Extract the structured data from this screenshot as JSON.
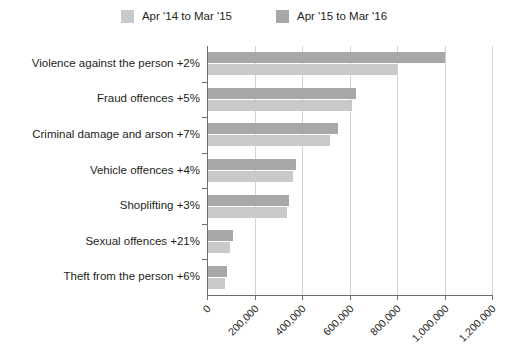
{
  "legend": {
    "entries": [
      {
        "label": "Apr '14 to Mar '15",
        "color": "#c9c9c9",
        "swatch_name": "legend-swatch-apr14-mar15"
      },
      {
        "label": "Apr '15 to Mar '16",
        "color": "#a8a8a8",
        "swatch_name": "legend-swatch-apr15-mar16"
      }
    ]
  },
  "chart_data": {
    "type": "bar",
    "orientation": "horizontal",
    "title": "",
    "subtitle": "",
    "xlabel": "",
    "ylabel": "",
    "xlim": [
      0,
      1200000
    ],
    "xticks": [
      0,
      200000,
      400000,
      600000,
      800000,
      1000000,
      1200000
    ],
    "xtick_labels": [
      "0",
      "200,000",
      "400,000",
      "600,000",
      "800,000",
      "1,000,000",
      "1,200,000"
    ],
    "grid": "vertical",
    "legend_position": "top-center",
    "categories": [
      "Violence against the person +2%",
      "Fraud offences +5%",
      "Criminal damage and arson +7%",
      "Vehicle offences +4%",
      "Shoplifting +3%",
      "Sexual offences +21%",
      "Theft from the person +6%"
    ],
    "series": [
      {
        "name": "Apr '14 to Mar '15",
        "color": "#c9c9c9",
        "values": [
          796000,
          606000,
          513000,
          358000,
          333000,
          92000,
          71000
        ]
      },
      {
        "name": "Apr '15 to Mar '16",
        "color": "#a8a8a8",
        "values": [
          998000,
          623000,
          547000,
          371000,
          341000,
          105000,
          80000
        ]
      }
    ]
  }
}
